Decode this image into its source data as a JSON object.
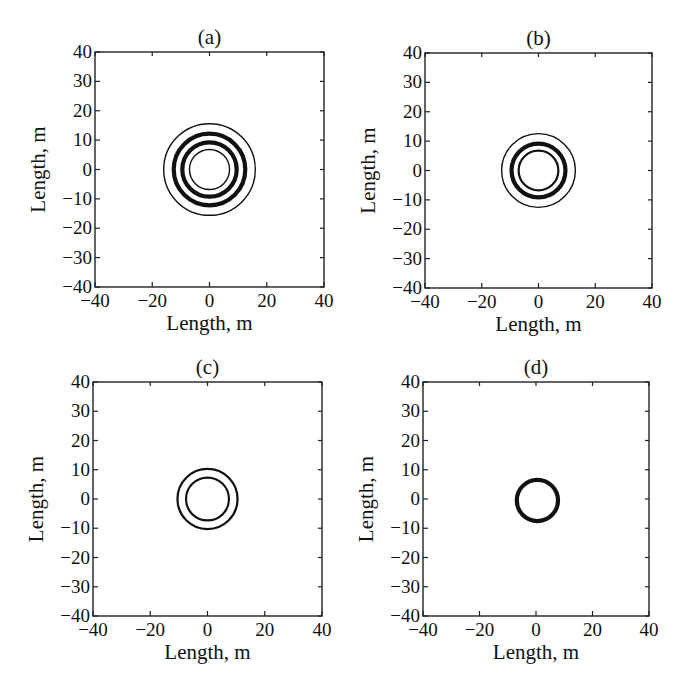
{
  "figure": {
    "panels": [
      {
        "id": "a",
        "title": "(a)",
        "box": {
          "x": 95,
          "y": 52,
          "w": 229,
          "h": 235
        }
      },
      {
        "id": "b",
        "title": "(b)",
        "box": {
          "x": 425,
          "y": 53,
          "w": 227,
          "h": 235
        }
      },
      {
        "id": "c",
        "title": "(c)",
        "box": {
          "x": 93,
          "y": 382,
          "w": 229,
          "h": 234
        }
      },
      {
        "id": "d",
        "title": "(d)",
        "box": {
          "x": 423,
          "y": 382,
          "w": 226,
          "h": 234
        }
      }
    ],
    "xticks": [
      "−40",
      "−20",
      "0",
      "20",
      "40"
    ],
    "yticks": [
      "40",
      "30",
      "20",
      "10",
      "0",
      "−10",
      "−20",
      "−30",
      "−40"
    ],
    "xlabel": "Length, m",
    "ylabel": "Length, m",
    "line_color": "#111111",
    "background": "#ffffff"
  },
  "chart_data": [
    {
      "type": "scatter",
      "title": "(a)",
      "xlabel": "Length, m",
      "ylabel": "Length, m",
      "xlim": [
        -40,
        40
      ],
      "ylim": [
        -40,
        40
      ],
      "xticks": [
        -40,
        -20,
        0,
        20,
        40
      ],
      "yticks": [
        -40,
        -30,
        -20,
        -10,
        0,
        10,
        20,
        30,
        40
      ],
      "grid": false,
      "legend": null,
      "description": "Concentric circular contours centered at origin",
      "series": [
        {
          "name": "ring-1",
          "center": [
            0,
            0
          ],
          "radius": 16.0,
          "line_width": "thin"
        },
        {
          "name": "ring-2",
          "center": [
            0,
            0
          ],
          "radius": 12.5,
          "line_width": "thick"
        },
        {
          "name": "ring-3",
          "center": [
            0,
            0
          ],
          "radius": 9.5,
          "line_width": "thick"
        },
        {
          "name": "ring-4",
          "center": [
            0,
            0
          ],
          "radius": 7.0,
          "line_width": "thin"
        }
      ]
    },
    {
      "type": "scatter",
      "title": "(b)",
      "xlabel": "Length, m",
      "ylabel": "Length, m",
      "xlim": [
        -40,
        40
      ],
      "ylim": [
        -40,
        40
      ],
      "xticks": [
        -40,
        -20,
        0,
        20,
        40
      ],
      "yticks": [
        -40,
        -30,
        -20,
        -10,
        0,
        10,
        20,
        30,
        40
      ],
      "grid": false,
      "legend": null,
      "description": "Concentric circular contours centered at origin",
      "series": [
        {
          "name": "ring-1",
          "center": [
            0,
            0
          ],
          "radius": 13.0,
          "line_width": "thin"
        },
        {
          "name": "ring-2",
          "center": [
            0,
            0
          ],
          "radius": 9.5,
          "line_width": "thick"
        },
        {
          "name": "ring-3",
          "center": [
            0,
            0
          ],
          "radius": 7.0,
          "line_width": "medium"
        }
      ]
    },
    {
      "type": "scatter",
      "title": "(c)",
      "xlabel": "Length, m",
      "ylabel": "Length, m",
      "xlim": [
        -40,
        40
      ],
      "ylim": [
        -40,
        40
      ],
      "xticks": [
        -40,
        -20,
        0,
        20,
        40
      ],
      "yticks": [
        -40,
        -30,
        -20,
        -10,
        0,
        10,
        20,
        30,
        40
      ],
      "grid": false,
      "legend": null,
      "description": "Two concentric circular contours centered at origin",
      "series": [
        {
          "name": "ring-1",
          "center": [
            0,
            0
          ],
          "radius": 10.5,
          "line_width": "medium"
        },
        {
          "name": "ring-2",
          "center": [
            0,
            0
          ],
          "radius": 7.5,
          "line_width": "medium"
        }
      ]
    },
    {
      "type": "scatter",
      "title": "(d)",
      "xlabel": "Length, m",
      "ylabel": "Length, m",
      "xlim": [
        -40,
        40
      ],
      "ylim": [
        -40,
        40
      ],
      "xticks": [
        -40,
        -20,
        0,
        20,
        40
      ],
      "yticks": [
        -40,
        -30,
        -20,
        -10,
        0,
        10,
        20,
        30,
        40
      ],
      "grid": false,
      "legend": null,
      "description": "Single circular contour centered near origin",
      "series": [
        {
          "name": "ring-1",
          "center": [
            0.5,
            -0.5
          ],
          "radius": 7.3,
          "line_width": "thick"
        }
      ]
    }
  ]
}
